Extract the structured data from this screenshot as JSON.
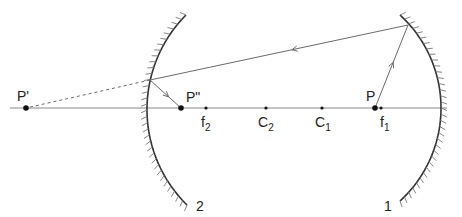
{
  "diagram": {
    "colors": {
      "axis": "#8a8a8a",
      "mirror": "#333333",
      "hatch": "#777777",
      "ray": "#6a6a6a",
      "point": "#111111"
    },
    "axis": {
      "x1": 10,
      "x2": 447,
      "y": 108
    },
    "mirrors": [
      {
        "id": "mirror-2",
        "label": "2",
        "vertex": [
          147,
          108
        ],
        "top": [
          186,
          15
        ],
        "bottom": [
          187,
          205
        ],
        "hatch_side": "outer-left",
        "label_pos": [
          196,
          211
        ]
      },
      {
        "id": "mirror-1",
        "label": "1",
        "vertex": [
          441,
          108
        ],
        "top": [
          400,
          15
        ],
        "bottom": [
          400,
          201
        ],
        "hatch_side": "outer-right",
        "label_pos": [
          384,
          211
        ]
      }
    ],
    "points": [
      {
        "id": "P-prime",
        "label": "P'",
        "sub": "",
        "x": 26,
        "y": 108,
        "size": "large",
        "label_pos": [
          17,
          101
        ]
      },
      {
        "id": "P-double-prime",
        "label": "P\"",
        "sub": "",
        "x": 181,
        "y": 108,
        "size": "large",
        "label_pos": [
          186,
          102
        ]
      },
      {
        "id": "f2",
        "label": "f",
        "sub": "2",
        "x": 206,
        "y": 108,
        "size": "small",
        "label_pos": [
          201,
          127
        ]
      },
      {
        "id": "C2",
        "label": "C",
        "sub": "2",
        "x": 266,
        "y": 108,
        "size": "small",
        "label_pos": [
          258,
          127
        ]
      },
      {
        "id": "C1",
        "label": "C",
        "sub": "1",
        "x": 322,
        "y": 108,
        "size": "small",
        "label_pos": [
          315,
          127
        ]
      },
      {
        "id": "P",
        "label": "P",
        "sub": "",
        "x": 375,
        "y": 108,
        "size": "large",
        "label_pos": [
          366,
          101
        ]
      },
      {
        "id": "f1",
        "label": "f",
        "sub": "1",
        "x": 381,
        "y": 108,
        "size": "small",
        "label_pos": [
          380,
          127
        ]
      }
    ],
    "rays": [
      {
        "id": "ray-P-to-mirror1",
        "from": [
          375,
          108
        ],
        "to": [
          408,
          25
        ],
        "style": "solid",
        "arrow_at": 0.55
      },
      {
        "id": "ray-mirror1-to-mirror2",
        "from": [
          408,
          25
        ],
        "to": [
          150,
          80
        ],
        "style": "solid",
        "arrow_at": 0.45
      },
      {
        "id": "ray-mirror2-to-P2",
        "from": [
          150,
          80
        ],
        "to": [
          181,
          108
        ],
        "style": "solid",
        "arrow_at": 0.6
      },
      {
        "id": "virtual-ray-to-P1",
        "from": [
          150,
          80
        ],
        "to": [
          26,
          108
        ],
        "style": "dashed",
        "arrow_at": null
      }
    ]
  }
}
